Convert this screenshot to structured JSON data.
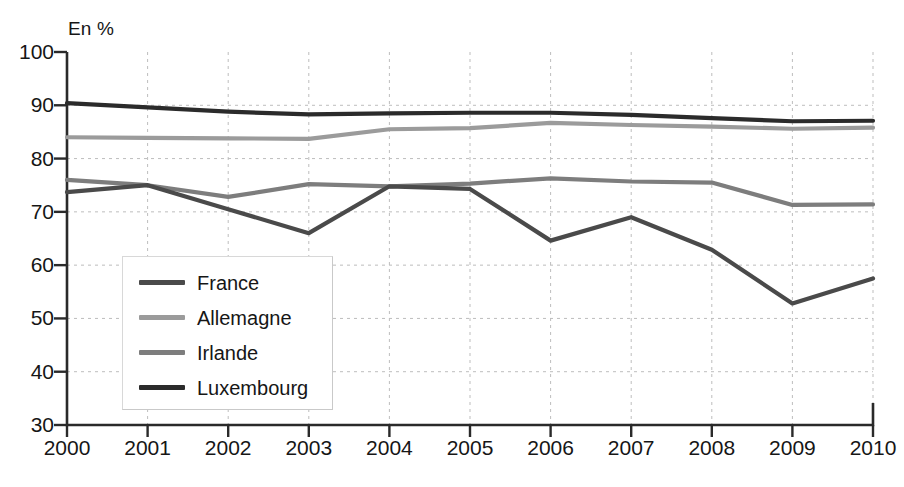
{
  "chart_data": {
    "type": "line",
    "title": "",
    "subtitle": "",
    "xlabel": "",
    "ylabel": "",
    "unit_label": "En %",
    "categories": [
      "2000",
      "2001",
      "2002",
      "2003",
      "2004",
      "2005",
      "2006",
      "2007",
      "2008",
      "2009",
      "2010"
    ],
    "x": [
      2000,
      2001,
      2002,
      2003,
      2004,
      2005,
      2006,
      2007,
      2008,
      2009,
      2010
    ],
    "xlim": [
      2000,
      2010
    ],
    "ylim": [
      30,
      100
    ],
    "y_ticks": [
      30,
      40,
      50,
      60,
      70,
      80,
      90,
      100
    ],
    "y_tick_labels": [
      "30",
      "40",
      "50",
      "60",
      "70",
      "80",
      "90",
      "100"
    ],
    "grid": "dotted-both",
    "legend_position": "inside-lower-left",
    "series": [
      {
        "name": "France",
        "color": "#4a4a4a",
        "values": [
          73.7,
          75.0,
          70.5,
          66.0,
          74.8,
          74.3,
          64.6,
          69.0,
          62.9,
          52.8,
          57.5
        ]
      },
      {
        "name": "Allemagne",
        "color": "#9b9b9b",
        "values": [
          84.0,
          83.9,
          83.8,
          83.7,
          85.5,
          85.7,
          86.7,
          86.3,
          86.0,
          85.6,
          85.8
        ]
      },
      {
        "name": "Irlande",
        "color": "#7d7d7d",
        "values": [
          76.0,
          75.0,
          72.8,
          75.2,
          74.8,
          75.3,
          76.3,
          75.7,
          75.5,
          71.3,
          71.4
        ]
      },
      {
        "name": "Luxembourg",
        "color": "#2b2b2b",
        "values": [
          90.4,
          89.6,
          88.8,
          88.3,
          88.5,
          88.6,
          88.6,
          88.2,
          87.6,
          87.0,
          87.1
        ]
      }
    ]
  },
  "legend": {
    "items": [
      {
        "label": "France"
      },
      {
        "label": "Allemagne"
      },
      {
        "label": "Irlande"
      },
      {
        "label": "Luxembourg"
      }
    ]
  },
  "axes": {
    "unit_label": "En %",
    "y_tick_labels": [
      "100",
      "90",
      "80",
      "70",
      "60",
      "50",
      "40",
      "30"
    ],
    "x_tick_labels": [
      "2000",
      "2001",
      "2002",
      "2003",
      "2004",
      "2005",
      "2006",
      "2007",
      "2008",
      "2009",
      "2010"
    ],
    "axis_color": "#2a2a2a",
    "grid_color": "#bdbdbd"
  }
}
